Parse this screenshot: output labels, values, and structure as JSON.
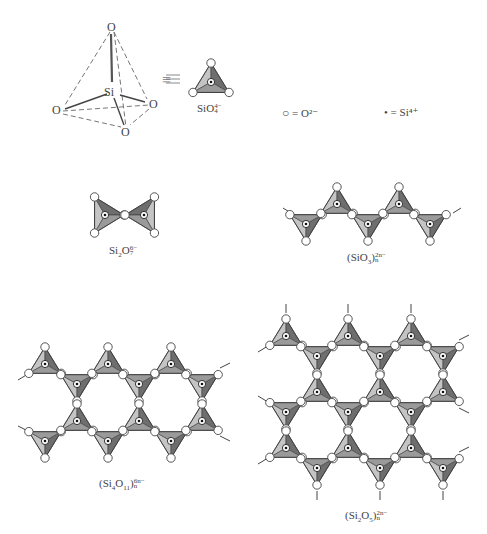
{
  "figure": {
    "colors": {
      "face_light": "#c4c4c4",
      "face_mid": "#9a9a9a",
      "face_dark": "#6e6e6e",
      "edge": "#3a3a3a",
      "oxygen_fill": "#ffffff",
      "line": "#555555"
    },
    "tetrahedron_3d": {
      "atoms": {
        "top": {
          "label": "O",
          "x": 112,
          "y": 28
        },
        "left": {
          "label": "O",
          "x": 57,
          "y": 111
        },
        "right": {
          "label": "O",
          "x": 154,
          "y": 105
        },
        "bottom": {
          "label": "O",
          "x": 126,
          "y": 132
        },
        "center": {
          "label": "Si",
          "x": 112,
          "y": 92
        }
      },
      "equiv_symbol": "≡"
    },
    "legend": {
      "oxygen": {
        "symbol": "○",
        "text": "= O²⁻"
      },
      "silicon": {
        "symbol": "•",
        "text": "= Si⁴⁺"
      }
    },
    "structures": [
      {
        "id": "orthosilicate",
        "formula_main": "SiO",
        "formula_sub": "4",
        "formula_sup": "4−",
        "n_sub": ""
      },
      {
        "id": "pyrosilicate",
        "formula_html": "Si₂O₇⁶⁻",
        "parts": [
          "Si",
          "2",
          "O",
          "7",
          "6−"
        ]
      },
      {
        "id": "chain",
        "parts": [
          "(SiO",
          "3",
          ")",
          "n",
          "2n−"
        ]
      },
      {
        "id": "double-chain",
        "parts": [
          "(Si",
          "4",
          "O",
          "11",
          ")",
          "n",
          "6n−"
        ]
      },
      {
        "id": "sheet",
        "parts": [
          "(Si",
          "2",
          "O",
          "5",
          ")",
          "n",
          "2n−"
        ]
      }
    ],
    "tetrahedra": {
      "single": [
        [
          211,
          84,
          "up"
        ]
      ],
      "pyro": [
        [
          105,
          215,
          "left"
        ],
        [
          144,
          215,
          "right"
        ]
      ],
      "chain": [
        [
          306,
          224,
          "down"
        ],
        [
          337,
          204,
          "up"
        ],
        [
          368,
          224,
          "down"
        ],
        [
          399,
          204,
          "up"
        ],
        [
          430,
          224,
          "down"
        ]
      ],
      "double_chain": [
        [
          45,
          364,
          "up"
        ],
        [
          77,
          384,
          "down"
        ],
        [
          108,
          364,
          "up"
        ],
        [
          139,
          384,
          "down"
        ],
        [
          171,
          364,
          "up"
        ],
        [
          202,
          384,
          "down"
        ],
        [
          45,
          441,
          "down"
        ],
        [
          77,
          421,
          "up"
        ],
        [
          108,
          441,
          "down"
        ],
        [
          139,
          421,
          "up"
        ],
        [
          171,
          441,
          "down"
        ],
        [
          202,
          421,
          "up"
        ]
      ],
      "sheet": [
        [
          286,
          336,
          "up"
        ],
        [
          317,
          356,
          "down"
        ],
        [
          348,
          336,
          "up"
        ],
        [
          380,
          356,
          "down"
        ],
        [
          411,
          336,
          "up"
        ],
        [
          443,
          356,
          "down"
        ],
        [
          286,
          412,
          "down"
        ],
        [
          317,
          392,
          "up"
        ],
        [
          348,
          412,
          "down"
        ],
        [
          380,
          392,
          "up"
        ],
        [
          411,
          412,
          "down"
        ],
        [
          443,
          392,
          "up"
        ],
        [
          286,
          448,
          "up"
        ],
        [
          317,
          468,
          "down"
        ],
        [
          348,
          448,
          "up"
        ],
        [
          380,
          468,
          "down"
        ],
        [
          411,
          448,
          "up"
        ],
        [
          443,
          468,
          "down"
        ]
      ]
    }
  }
}
